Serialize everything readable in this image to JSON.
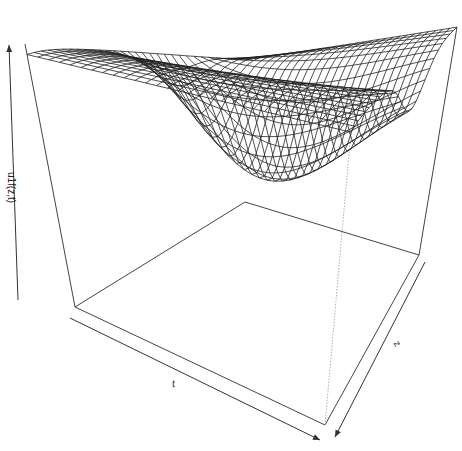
{
  "chart_data": {
    "type": "surface",
    "title": "",
    "xlabel": "t",
    "ylabel": "z",
    "zlabel": "u1f(z,t)",
    "grid": false,
    "axis_style": "arrows, no ticks",
    "mesh": {
      "nx": 30,
      "ny": 30
    },
    "box_projection": {
      "top_left": [
        25,
        44
      ],
      "top_back": [
        245,
        60
      ],
      "top_right": [
        457,
        27
      ],
      "bottom_left": [
        75,
        307
      ],
      "bottom_back": [
        245,
        202
      ],
      "bottom_right": [
        419,
        255
      ],
      "bottom_front": [
        325,
        425
      ]
    },
    "colors": {
      "line": "#222222",
      "box": "#444444",
      "hidden": "#999999",
      "background": "#ffffff"
    }
  }
}
